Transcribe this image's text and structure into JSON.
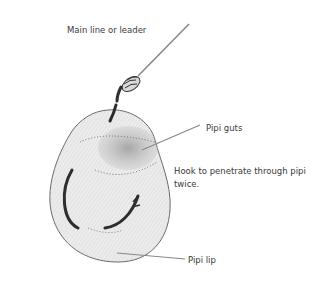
{
  "diagram": {
    "type": "illustration",
    "labels": {
      "main_line": "Main line or leader",
      "guts": "Pipi guts",
      "hook_line1": "Hook to penetrate through pipi",
      "hook_line2": "twice.",
      "lip": "Pipi lip"
    },
    "colors": {
      "text": "#3a3a3a",
      "leader_line": "#888888",
      "pipi_body": "#e4e4e4",
      "guts": "#8a8a8a",
      "hook": "#2e2e2e"
    }
  }
}
